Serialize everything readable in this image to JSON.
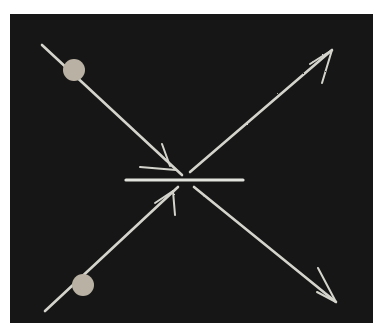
{
  "diagram": {
    "type": "particle-collision",
    "style": "chalk-on-blackboard",
    "colors": {
      "board": "#161616",
      "chalk": "#d8d8d0",
      "particle": "#bdb6a8",
      "page": "#ffffff"
    },
    "incoming_particles": [
      {
        "id": "particle-a",
        "direction": "down-right",
        "dot": {
          "cx": 74,
          "cy": 70,
          "r": 11
        },
        "line": {
          "x1": 42,
          "y1": 45,
          "x2": 182,
          "y2": 175
        }
      },
      {
        "id": "particle-b",
        "direction": "up-right",
        "dot": {
          "cx": 83,
          "cy": 285,
          "r": 11
        },
        "line": {
          "x1": 45,
          "y1": 311,
          "x2": 178,
          "y2": 187
        }
      }
    ],
    "outgoing_tracks": [
      {
        "id": "track-up-right",
        "line": {
          "x1": 190,
          "y1": 172,
          "x2": 332,
          "y2": 50
        }
      },
      {
        "id": "track-down-right",
        "line": {
          "x1": 194,
          "y1": 187,
          "x2": 336,
          "y2": 302
        }
      }
    ],
    "interaction_bar": {
      "x1": 126,
      "y1": 180,
      "x2": 243,
      "y2": 180
    }
  }
}
